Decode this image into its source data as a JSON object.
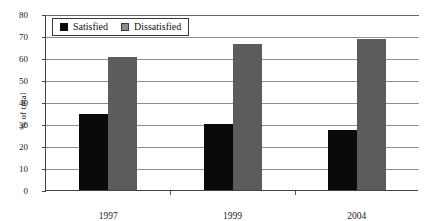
{
  "chart_data": {
    "type": "bar",
    "title": "",
    "subtitle": "",
    "xlabel": "",
    "ylabel": "% of total",
    "ylim": [
      0,
      80
    ],
    "ytick_step": 10,
    "yticks": [
      0,
      10,
      20,
      30,
      40,
      50,
      60,
      70,
      80
    ],
    "ytick_labels": [
      "0",
      "10",
      "20",
      "30",
      "40",
      "50",
      "60",
      "70",
      "80"
    ],
    "grid": "horizontal",
    "legend_position": "top-left inside",
    "categories": [
      "1997",
      "1999",
      "2004"
    ],
    "series": [
      {
        "name": "Satisfied",
        "color": "#0a0a0a",
        "values": [
          34.5,
          30.0,
          27.5
        ]
      },
      {
        "name": "Dissatisfied",
        "color": "#5c5c5c",
        "values": [
          60.5,
          66.5,
          68.5
        ]
      }
    ],
    "annotations": []
  },
  "legend": {
    "items": [
      {
        "label": "Satisfied",
        "swatch": "black-square"
      },
      {
        "label": "Dissatisfied",
        "swatch": "gray-square"
      }
    ]
  },
  "colors": {
    "satisfied": "#0a0a0a",
    "dissatisfied": "#5c5c5c",
    "gridline": "#8e8e8e",
    "axis": "#444444",
    "background": "#ffffff"
  }
}
